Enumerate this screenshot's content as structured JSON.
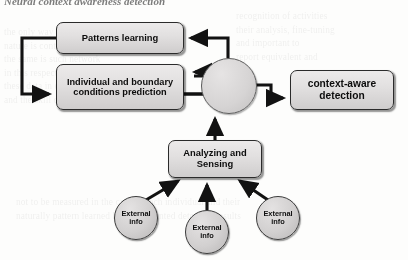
{
  "page": {
    "heading": "Neural context awareness detection",
    "ghost_text_left": "the only way to consider\nnature is continuous, and\nthe same is such network\nin this respect, the fact\nthese data in each region\nand the skill constraints",
    "ghost_text_right": "recognition of activities\ntheir analysis, fine-tuning\nand important to\nreport equivalent and",
    "ghost_text_bottom": "not to be measured in the case of each individual and their\nnaturally pattern learned by the presented detection results"
  },
  "diagram": {
    "nodes": {
      "patterns_learning": "Patterns learning",
      "prediction": "Individual and boundary conditions prediction",
      "context_aware": "context-aware detection",
      "analyzing_sensing": "Analyzing and Sensing",
      "junction": "merge junction"
    },
    "external_info": [
      {
        "label": "External info"
      },
      {
        "label": "External info"
      },
      {
        "label": "External info"
      }
    ],
    "colors": {
      "node_fill_top": "#eceaea",
      "node_fill_bottom": "#cfcdcd",
      "node_border": "#2b2b2b",
      "arrow": "#121212",
      "ellipse_fill": "#d2d0d0",
      "page_background": "#fdfdfc"
    }
  }
}
